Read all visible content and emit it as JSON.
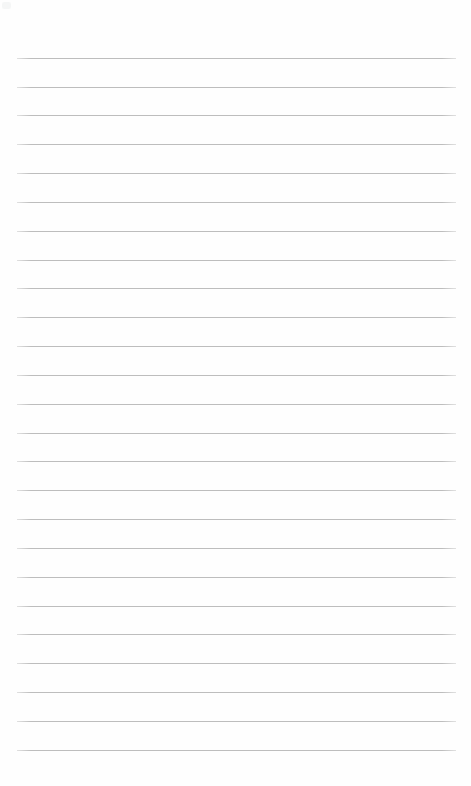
{
  "document": {
    "kind": "lined-paper-sheet",
    "title": "",
    "header_text": "",
    "footer_text": "",
    "page_number": "",
    "body_text": "",
    "is_blank": true
  },
  "canvas": {
    "width": 471,
    "height": 786,
    "background_color": "#fefefe"
  },
  "ruling": {
    "style": "wide-ruled",
    "line_count": 25,
    "line_color": "#bdbdbd",
    "line_thickness_px": 1,
    "line_spacing_px": 28.85,
    "first_line_y": 58,
    "last_line_y": 750,
    "line_left_x": 17,
    "line_right_x": 456,
    "line_length_px": 439,
    "has_margin_rule": false,
    "has_holes": false
  },
  "margins": {
    "top_px": 58,
    "bottom_px": 36,
    "left_px": 17,
    "right_px": 15
  },
  "lines": [
    {
      "index": 1,
      "y": 58,
      "text": ""
    },
    {
      "index": 2,
      "y": 87,
      "text": ""
    },
    {
      "index": 3,
      "y": 115,
      "text": ""
    },
    {
      "index": 4,
      "y": 144,
      "text": ""
    },
    {
      "index": 5,
      "y": 173,
      "text": ""
    },
    {
      "index": 6,
      "y": 202,
      "text": ""
    },
    {
      "index": 7,
      "y": 231,
      "text": ""
    },
    {
      "index": 8,
      "y": 260,
      "text": ""
    },
    {
      "index": 9,
      "y": 288,
      "text": ""
    },
    {
      "index": 10,
      "y": 317,
      "text": ""
    },
    {
      "index": 11,
      "y": 346,
      "text": ""
    },
    {
      "index": 12,
      "y": 375,
      "text": ""
    },
    {
      "index": 13,
      "y": 404,
      "text": ""
    },
    {
      "index": 14,
      "y": 433,
      "text": ""
    },
    {
      "index": 15,
      "y": 461,
      "text": ""
    },
    {
      "index": 16,
      "y": 490,
      "text": ""
    },
    {
      "index": 17,
      "y": 519,
      "text": ""
    },
    {
      "index": 18,
      "y": 548,
      "text": ""
    },
    {
      "index": 19,
      "y": 577,
      "text": ""
    },
    {
      "index": 20,
      "y": 606,
      "text": ""
    },
    {
      "index": 21,
      "y": 634,
      "text": ""
    },
    {
      "index": 22,
      "y": 663,
      "text": ""
    },
    {
      "index": 23,
      "y": 692,
      "text": ""
    },
    {
      "index": 24,
      "y": 721,
      "text": ""
    },
    {
      "index": 25,
      "y": 750,
      "text": ""
    }
  ],
  "artifacts": {
    "corner_speck": {
      "present": true,
      "x": 2,
      "y": 2,
      "color": "#f3f4f5"
    }
  }
}
